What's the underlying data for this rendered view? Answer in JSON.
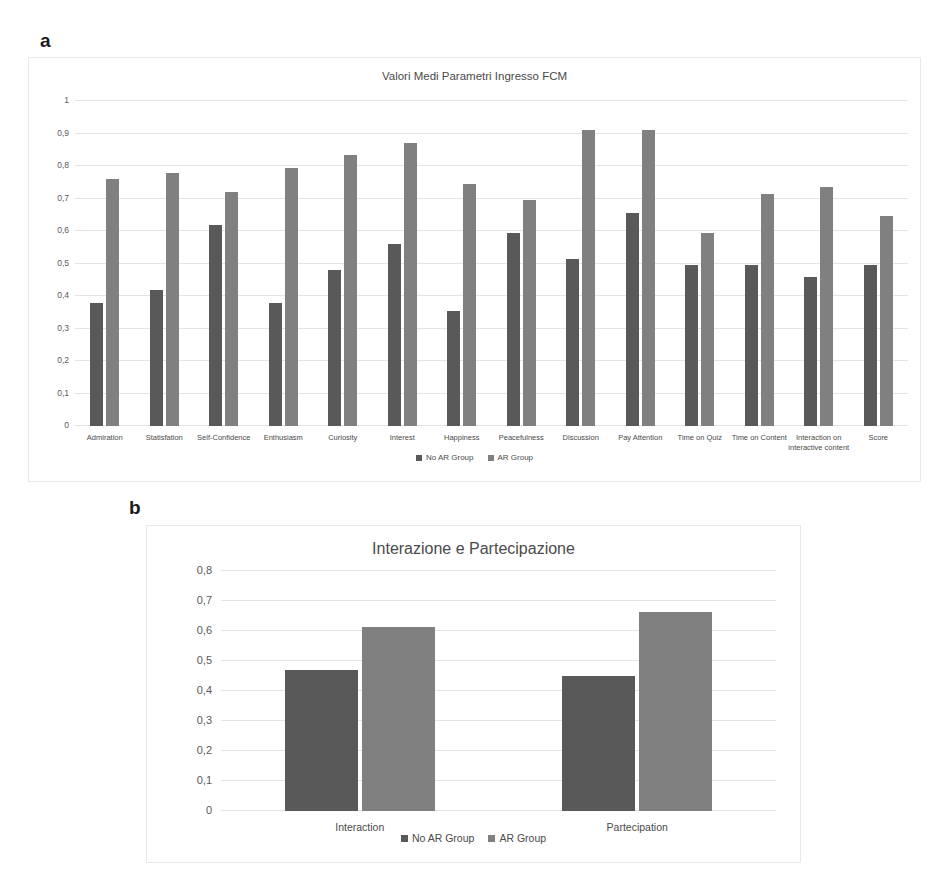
{
  "figure": {
    "panel_a_label": "a",
    "panel_b_label": "b"
  },
  "chart_data": [
    {
      "id": "panel-a",
      "type": "bar",
      "title": "Valori Medi Parametri Ingresso FCM",
      "xlabel": "",
      "ylabel": "",
      "ylim": [
        0,
        1
      ],
      "yticks": [
        "0",
        "0,1",
        "0,2",
        "0,3",
        "0,4",
        "0,5",
        "0,6",
        "0,7",
        "0,8",
        "0,9",
        "1"
      ],
      "ytick_values": [
        0,
        0.1,
        0.2,
        0.3,
        0.4,
        0.5,
        0.6,
        0.7,
        0.8,
        0.9,
        1
      ],
      "grid": true,
      "legend_position": "bottom",
      "categories": [
        "Admiration",
        "Statisfation",
        "Self-Confidence",
        "Enthusiasm",
        "Curiosity",
        "Interest",
        "Happiness",
        "Peacefulness",
        "Discussion",
        "Pay Attention",
        "Time on Quiz",
        "Time on Content",
        "Interaction on interactive content",
        "Score"
      ],
      "series": [
        {
          "name": "No AR Group",
          "color": "#595959",
          "values": [
            0.38,
            0.42,
            0.62,
            0.38,
            0.48,
            0.56,
            0.355,
            0.595,
            0.515,
            0.655,
            0.495,
            0.495,
            0.46,
            0.495
          ]
        },
        {
          "name": "AR Group",
          "color": "#808080",
          "values": [
            0.76,
            0.78,
            0.72,
            0.795,
            0.835,
            0.87,
            0.745,
            0.695,
            0.91,
            0.91,
            0.595,
            0.715,
            0.735,
            0.645
          ]
        }
      ]
    },
    {
      "id": "panel-b",
      "type": "bar",
      "title": "Interazione e Partecipazione",
      "xlabel": "",
      "ylabel": "",
      "ylim": [
        0,
        0.8
      ],
      "yticks": [
        "0",
        "0,1",
        "0,2",
        "0,3",
        "0,4",
        "0,5",
        "0,6",
        "0,7",
        "0,8"
      ],
      "ytick_values": [
        0,
        0.1,
        0.2,
        0.3,
        0.4,
        0.5,
        0.6,
        0.7,
        0.8
      ],
      "grid": true,
      "legend_position": "bottom",
      "categories": [
        "Interaction",
        "Partecipation"
      ],
      "series": [
        {
          "name": "No AR Group",
          "color": "#595959",
          "values": [
            0.47,
            0.45
          ]
        },
        {
          "name": "AR Group",
          "color": "#808080",
          "values": [
            0.615,
            0.665
          ]
        }
      ]
    }
  ]
}
